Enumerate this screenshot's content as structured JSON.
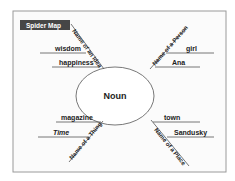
{
  "title": "Spider Map",
  "center": "Noun",
  "colors": {
    "frame_border": "#9a9a9a",
    "frame_bg": "#fbfbfb",
    "badge_bg": "#464646",
    "badge_text": "#ffffff",
    "line": "#555555"
  },
  "branches": [
    {
      "category": "Name of an Idea",
      "position": "top-left",
      "details": [
        "wisdom",
        "happiness"
      ]
    },
    {
      "category": "Name of a Person",
      "position": "top-right",
      "details": [
        "girl",
        "Ana"
      ]
    },
    {
      "category": "Name of a Thing",
      "position": "bottom-left",
      "details": [
        "magazine",
        "Time"
      ]
    },
    {
      "category": "Name of a Place",
      "position": "bottom-right",
      "details": [
        "town",
        "Sandusky"
      ]
    }
  ]
}
